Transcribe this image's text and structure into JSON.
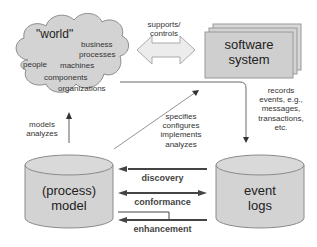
{
  "diagram": {
    "world": {
      "title": "\"world\"",
      "items": [
        "business",
        "processes",
        "people",
        "machines",
        "components",
        "organizations"
      ]
    },
    "supports_controls": [
      "supports/",
      "controls"
    ],
    "software_system": [
      "software",
      "system"
    ],
    "records": [
      "records",
      "events, e.g.,",
      "messages,",
      "transactions,",
      "etc."
    ],
    "models_analyzes": [
      "models",
      "analyzes"
    ],
    "specifies": [
      "specifies",
      "configures",
      "implements",
      "analyzes"
    ],
    "process_model": [
      "(process)",
      "model"
    ],
    "event_logs": [
      "event",
      "logs"
    ],
    "relations": {
      "discovery": "discovery",
      "conformance": "conformance",
      "enhancement": "enhancement"
    },
    "colors": {
      "shape_fill": "#d3d3d3",
      "shape_stroke": "#8a8a8a",
      "arrow_dark": "#3a3a3a",
      "block_arrow_fill": "#e8e8e8"
    }
  }
}
